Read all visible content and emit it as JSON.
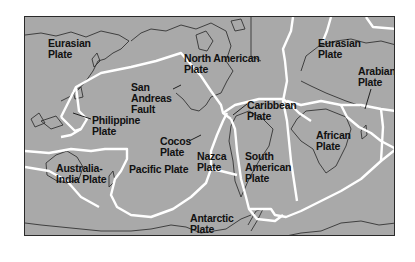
{
  "map": {
    "title": "Tectonic plates of the world",
    "colors": {
      "ocean_land": "#a9a9a9",
      "boundary": "#ffffff",
      "coast": "#333333",
      "label": "#111111"
    },
    "labels": [
      {
        "id": "eurasian-west",
        "text": "Eurasian\nPlate",
        "x": 47,
        "y": 37
      },
      {
        "id": "north-american",
        "text": "North American\nPlate",
        "x": 183,
        "y": 52
      },
      {
        "id": "eurasian-east",
        "text": "Eurasian\nPlate",
        "x": 317,
        "y": 37
      },
      {
        "id": "arabian",
        "text": "Arabian\nPlate",
        "x": 357,
        "y": 65
      },
      {
        "id": "san-andreas",
        "text": "San\nAndreas\nFault",
        "x": 130,
        "y": 81
      },
      {
        "id": "philippine",
        "text": "Philippine\nPlate",
        "x": 91,
        "y": 114
      },
      {
        "id": "caribbean",
        "text": "Caribbean\nPlate",
        "x": 246,
        "y": 99
      },
      {
        "id": "cocos",
        "text": "Cocos\nPlate",
        "x": 159,
        "y": 135
      },
      {
        "id": "african",
        "text": "African\nPlate",
        "x": 315,
        "y": 129
      },
      {
        "id": "australia-india",
        "text": "Australia-\nIndia Plate",
        "x": 55,
        "y": 162
      },
      {
        "id": "pacific",
        "text": "Pacific Plate",
        "x": 128,
        "y": 163
      },
      {
        "id": "nazca",
        "text": "Nazca\nPlate",
        "x": 196,
        "y": 150
      },
      {
        "id": "south-american",
        "text": "South\nAmerican\nPlate",
        "x": 244,
        "y": 150
      },
      {
        "id": "antarctic",
        "text": "Antarctic\nPlate",
        "x": 189,
        "y": 212
      }
    ]
  }
}
